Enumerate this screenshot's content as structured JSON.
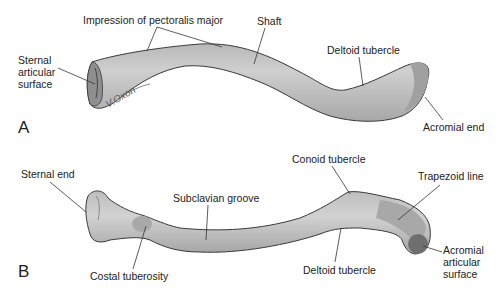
{
  "figure": {
    "colors": {
      "bone_fill": "#c9c9c9",
      "bone_shadow": "#9e9e9e",
      "bone_outline": "#3a3a3a",
      "text": "#222222",
      "background": "#ffffff"
    },
    "panels": [
      {
        "letter": "A",
        "view": "superior",
        "labels": {
          "sternal_articular_surface": [
            "Sternal",
            "articular",
            "surface"
          ],
          "impression_pectoralis": "Impression of pectoralis major",
          "shaft": "Shaft",
          "deltoid_tubercle": "Deltoid tubercle",
          "acromial_end": "Acromial end"
        },
        "signature": "V.Oxon"
      },
      {
        "letter": "B",
        "view": "inferior",
        "labels": {
          "sternal_end": "Sternal end",
          "subclavian_groove": "Subclavian groove",
          "costal_tuberosity": "Costal tuberosity",
          "conoid_tubercle": "Conoid tubercle",
          "trapezoid_line": "Trapezoid line",
          "deltoid_tubercle": "Deltoid tubercle",
          "acromial_articular_surface": [
            "Acromial",
            "articular",
            "surface"
          ]
        }
      }
    ]
  }
}
